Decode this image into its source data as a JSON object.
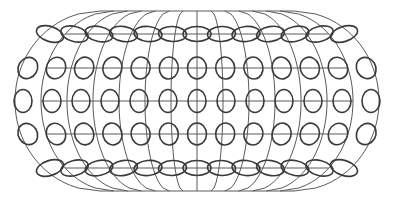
{
  "diagram": {
    "type": "map-projection-with-tissot-indicatrices",
    "colors": {
      "background": "#ffffff",
      "graticule": "#5a5a5a",
      "indicatrix": "#3a3a3a"
    },
    "center_x": 197,
    "pole_top_y": 11,
    "pole_bottom_y": 191,
    "pole_half_width": 97,
    "equator_half_width": 182,
    "meridian_count": 13,
    "rows": [
      {
        "name": "north-60",
        "y": 34,
        "x_step": 24.5,
        "rx": 14,
        "ry": 7.5,
        "tilt_max": 18
      },
      {
        "name": "north-30",
        "y": 68,
        "x_step": 28.2,
        "rx": 9.5,
        "ry": 11,
        "tilt_max": 30
      },
      {
        "name": "equator",
        "y": 101,
        "x_step": 29,
        "rx": 9,
        "ry": 11.5,
        "tilt_max": 0
      },
      {
        "name": "south-30",
        "y": 134,
        "x_step": 28.2,
        "rx": 9.5,
        "ry": 11,
        "tilt_max": -30
      },
      {
        "name": "south-60",
        "y": 168,
        "x_step": 24.5,
        "rx": 14,
        "ry": 7.5,
        "tilt_max": -18
      }
    ]
  }
}
